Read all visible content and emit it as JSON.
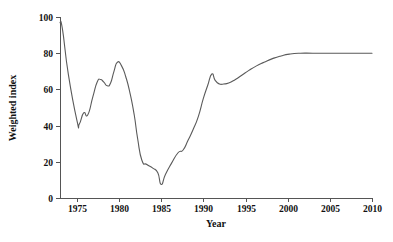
{
  "chart_data": {
    "type": "line",
    "title": "",
    "xlabel": "Year",
    "ylabel": "Weighted index",
    "xlim": [
      1973,
      2010
    ],
    "ylim": [
      0,
      100
    ],
    "grid": false,
    "legend": "none",
    "xticks": [
      1975,
      1980,
      1985,
      1990,
      1995,
      2000,
      2005,
      2010
    ],
    "xtick_labels": [
      "1975",
      "1980",
      "1985",
      "1990",
      "1995",
      "2000",
      "2005",
      "2010"
    ],
    "yticks": [
      0,
      20,
      40,
      60,
      80,
      100
    ],
    "ytick_labels": [
      "0",
      "20",
      "40",
      "60",
      "80",
      "100"
    ],
    "line_color": "#5a5a5a",
    "series": [
      {
        "name": "Weighted index",
        "x": [
          1973.0,
          1973.3,
          1974.0,
          1975.0,
          1975.3,
          1975.8,
          1976.3,
          1976.9,
          1977.4,
          1977.8,
          1978.2,
          1978.6,
          1979.0,
          1979.4,
          1979.8,
          1980.3,
          1980.8,
          1981.3,
          1981.8,
          1982.2,
          1982.7,
          1983.3,
          1984.0,
          1984.6,
          1985.0,
          1985.5,
          1986.2,
          1987.0,
          1987.6,
          1988.2,
          1988.8,
          1989.4,
          1990.0,
          1990.5,
          1991.0,
          1991.4,
          1991.9,
          1992.4,
          1993.0,
          1993.8,
          1994.6,
          1995.4,
          1996.3,
          1997.2,
          1998.2,
          1999.2,
          2000.2,
          2001.5,
          2003.0,
          2005.0,
          2007.5,
          2010.0
        ],
        "y": [
          97.0,
          93.0,
          68.0,
          43.0,
          41.0,
          47.0,
          46.0,
          56.0,
          64.0,
          65.5,
          64.0,
          62.0,
          63.5,
          70.0,
          75.0,
          73.0,
          67.0,
          58.0,
          46.0,
          33.0,
          21.0,
          18.5,
          16.5,
          14.0,
          7.5,
          13.0,
          19.0,
          25.0,
          26.5,
          32.0,
          38.0,
          45.0,
          55.0,
          62.0,
          68.5,
          65.0,
          63.0,
          63.0,
          63.5,
          65.5,
          68.0,
          70.5,
          73.0,
          75.0,
          77.0,
          78.5,
          79.5,
          80.0,
          80.0,
          80.0,
          80.0,
          80.0
        ]
      }
    ]
  },
  "axes_geometry": {
    "plot_left": 60,
    "plot_right": 372,
    "plot_top": 17,
    "plot_bottom": 198
  }
}
